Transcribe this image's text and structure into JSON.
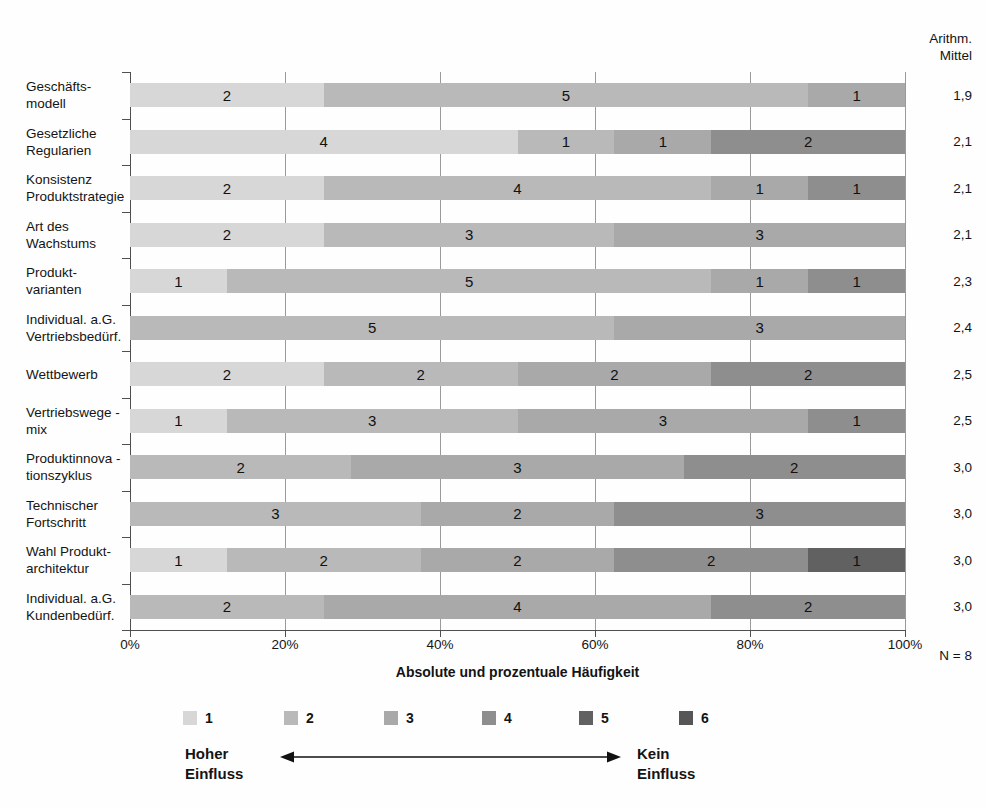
{
  "mean_header": {
    "line1": "Arithm.",
    "line2": "Mittel"
  },
  "axis": {
    "tick_labels": [
      "0%",
      "20%",
      "40%",
      "60%",
      "80%",
      "100%"
    ],
    "title": "Absolute und prozentuale Häufigkeit",
    "n_label": "N = 8"
  },
  "legend": {
    "items": [
      {
        "label": "1",
        "color": "#d7d7d7"
      },
      {
        "label": "2",
        "color": "#b9b9b9"
      },
      {
        "label": "3",
        "color": "#a9a9a9"
      },
      {
        "label": "4",
        "color": "#8e8e8e"
      },
      {
        "label": "5",
        "color": "#616161"
      },
      {
        "label": "6",
        "color": "#565656"
      }
    ],
    "scale_left": [
      "Hoher",
      "Einfluss"
    ],
    "scale_right": [
      "Kein",
      "Einfluss"
    ]
  },
  "chart_data": {
    "type": "bar",
    "subtype": "horizontal-stacked-100percent",
    "xlabel": "Absolute und prozentuale Häufigkeit",
    "xlim": [
      0,
      100
    ],
    "x_ticks": [
      "0%",
      "20%",
      "40%",
      "60%",
      "80%",
      "100%"
    ],
    "n_label": "N = 8",
    "mean_column_header": "Arithm. Mittel",
    "rating_scale": {
      "1": "Hoher Einfluss",
      "6": "Kein Einfluss"
    },
    "legend_values": [
      "1",
      "2",
      "3",
      "4",
      "5",
      "6"
    ],
    "rows": [
      {
        "label_lines": [
          "Geschäfts-",
          "modell"
        ],
        "mean": "1,9",
        "segments": [
          {
            "rating": 1,
            "count": 2
          },
          {
            "rating": 2,
            "count": 5
          },
          {
            "rating": 3,
            "count": 1
          }
        ]
      },
      {
        "label_lines": [
          "Gesetzliche",
          "Regularien"
        ],
        "mean": "2,1",
        "segments": [
          {
            "rating": 1,
            "count": 4
          },
          {
            "rating": 2,
            "count": 1
          },
          {
            "rating": 3,
            "count": 1
          },
          {
            "rating": 4,
            "count": 2
          }
        ]
      },
      {
        "label_lines": [
          "Konsistenz",
          "Produktstrategie"
        ],
        "mean": "2,1",
        "segments": [
          {
            "rating": 1,
            "count": 2
          },
          {
            "rating": 2,
            "count": 4
          },
          {
            "rating": 3,
            "count": 1
          },
          {
            "rating": 4,
            "count": 1
          }
        ]
      },
      {
        "label_lines": [
          "Art des",
          "Wachstums"
        ],
        "mean": "2,1",
        "segments": [
          {
            "rating": 1,
            "count": 2
          },
          {
            "rating": 2,
            "count": 3
          },
          {
            "rating": 3,
            "count": 3
          }
        ]
      },
      {
        "label_lines": [
          "Produkt-",
          "varianten"
        ],
        "mean": "2,3",
        "segments": [
          {
            "rating": 1,
            "count": 1
          },
          {
            "rating": 2,
            "count": 5
          },
          {
            "rating": 3,
            "count": 1
          },
          {
            "rating": 4,
            "count": 1
          }
        ]
      },
      {
        "label_lines": [
          "Individual. a.G.",
          "Vertriebsbedürf."
        ],
        "mean": "2,4",
        "segments": [
          {
            "rating": 2,
            "count": 5
          },
          {
            "rating": 3,
            "count": 3
          }
        ]
      },
      {
        "label_lines": [
          "Wettbewerb"
        ],
        "mean": "2,5",
        "segments": [
          {
            "rating": 1,
            "count": 2
          },
          {
            "rating": 2,
            "count": 2
          },
          {
            "rating": 3,
            "count": 2
          },
          {
            "rating": 4,
            "count": 2
          }
        ]
      },
      {
        "label_lines": [
          "Vertriebswege -",
          "mix"
        ],
        "mean": "2,5",
        "segments": [
          {
            "rating": 1,
            "count": 1
          },
          {
            "rating": 2,
            "count": 3
          },
          {
            "rating": 3,
            "count": 3
          },
          {
            "rating": 4,
            "count": 1
          }
        ]
      },
      {
        "label_lines": [
          "Produktinnova -",
          "tionszyklus"
        ],
        "mean": "3,0",
        "segments": [
          {
            "rating": 2,
            "count": 2
          },
          {
            "rating": 3,
            "count": 3
          },
          {
            "rating": 4,
            "count": 2
          }
        ]
      },
      {
        "label_lines": [
          "Technischer",
          "Fortschritt"
        ],
        "mean": "3,0",
        "segments": [
          {
            "rating": 2,
            "count": 3
          },
          {
            "rating": 3,
            "count": 2
          },
          {
            "rating": 4,
            "count": 3
          }
        ]
      },
      {
        "label_lines": [
          "Wahl Produkt-",
          "architektur"
        ],
        "mean": "3,0",
        "segments": [
          {
            "rating": 1,
            "count": 1
          },
          {
            "rating": 2,
            "count": 2
          },
          {
            "rating": 3,
            "count": 2
          },
          {
            "rating": 4,
            "count": 2
          },
          {
            "rating": 5,
            "count": 1
          }
        ]
      },
      {
        "label_lines": [
          "Individual. a.G.",
          "Kundenbedürf."
        ],
        "mean": "3,0",
        "segments": [
          {
            "rating": 2,
            "count": 2
          },
          {
            "rating": 3,
            "count": 4
          },
          {
            "rating": 4,
            "count": 2
          }
        ]
      }
    ]
  }
}
